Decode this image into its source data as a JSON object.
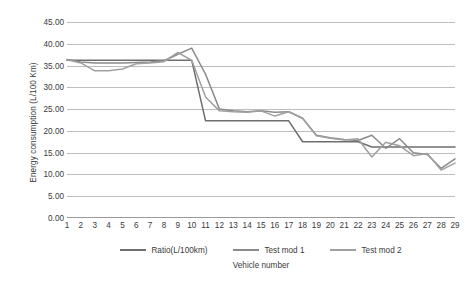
{
  "chart_data": {
    "type": "line",
    "title": "",
    "xlabel": "Vehicle number",
    "ylabel": "Energy consumption (L/100 Km)",
    "x": [
      1,
      2,
      3,
      4,
      5,
      6,
      7,
      8,
      9,
      10,
      11,
      12,
      13,
      14,
      15,
      16,
      17,
      18,
      19,
      20,
      21,
      22,
      23,
      24,
      25,
      26,
      27,
      28,
      29
    ],
    "xlim": [
      1,
      29
    ],
    "ylim": [
      0,
      45
    ],
    "yticks": [
      0,
      5,
      10,
      15,
      20,
      25,
      30,
      35,
      40,
      45
    ],
    "ytick_labels": [
      "0.00",
      "5.00",
      "10.00",
      "15.00",
      "20.00",
      "25.00",
      "30.00",
      "35.00",
      "40.00",
      "45.00"
    ],
    "xtick_labels": [
      "1",
      "2",
      "3",
      "4",
      "5",
      "6",
      "7",
      "8",
      "9",
      "10",
      "11",
      "12",
      "13",
      "14",
      "15",
      "16",
      "17",
      "18",
      "19",
      "20",
      "21",
      "22",
      "23",
      "24",
      "25",
      "26",
      "27",
      "28",
      "29"
    ],
    "grid": true,
    "legend_position": "bottom",
    "series": [
      {
        "name": "Ratio(L/100km)",
        "color": "#6e6e6e",
        "values": [
          36.2,
          36.2,
          36.2,
          36.2,
          36.2,
          36.2,
          36.2,
          36.2,
          36.2,
          36.2,
          22.3,
          22.3,
          22.3,
          22.3,
          22.3,
          22.3,
          22.3,
          17.5,
          17.5,
          17.5,
          17.5,
          17.5,
          16.3,
          16.3,
          16.3,
          16.3,
          16.3,
          16.3,
          16.3
        ]
      },
      {
        "name": "Test mod 1",
        "color": "#8a8a8a",
        "values": [
          36.4,
          35.8,
          35.6,
          35.6,
          35.6,
          35.7,
          35.8,
          36.1,
          37.6,
          39.0,
          33.0,
          25.0,
          24.6,
          24.4,
          24.6,
          24.3,
          24.4,
          22.9,
          19.0,
          18.4,
          18.0,
          17.8,
          19.0,
          16.0,
          18.2,
          15.0,
          14.6,
          11.4,
          13.6
        ]
      },
      {
        "name": "Test mod 2",
        "color": "#a0a0a0",
        "values": [
          36.3,
          35.6,
          33.8,
          33.8,
          34.2,
          35.4,
          35.6,
          35.9,
          38.0,
          36.2,
          27.8,
          24.6,
          24.4,
          24.3,
          24.6,
          23.4,
          24.4,
          22.9,
          18.9,
          18.3,
          17.9,
          18.2,
          14.0,
          17.4,
          16.6,
          14.3,
          14.8,
          11.0,
          12.6
        ]
      }
    ]
  },
  "legend": {
    "items": [
      {
        "label": "Ratio(L/100km)"
      },
      {
        "label": "Test mod 1"
      },
      {
        "label": "Test mod 2"
      }
    ]
  }
}
